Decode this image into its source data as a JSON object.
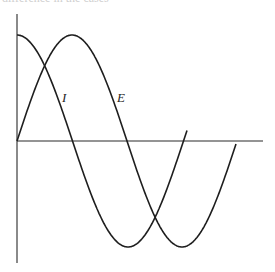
{
  "header": {
    "clipped_caption": "difference in the cases"
  },
  "diagram": {
    "type": "phase-diagram",
    "colors": {
      "line": "#1e1e1e",
      "background": "#ffffff"
    },
    "axes": {
      "origin": [
        17,
        141
      ],
      "vertical": {
        "top": 14,
        "bottom": 263
      },
      "horizontal": {
        "left": 17,
        "right": 263
      }
    },
    "curves": [
      {
        "name": "I",
        "label": "I",
        "shape": "cosine",
        "start_x": 17,
        "end_x": 187,
        "amplitude_px": 106,
        "half_period_px": 111,
        "label_pos": [
          62,
          102
        ]
      },
      {
        "name": "E",
        "label": "E",
        "shape": "sine",
        "start_x": 17,
        "end_x": 236,
        "amplitude_px": 106,
        "half_period_px": 110,
        "label_pos": [
          117,
          102
        ]
      }
    ]
  }
}
